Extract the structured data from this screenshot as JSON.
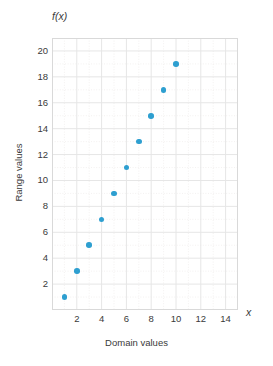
{
  "chart_data": {
    "type": "scatter",
    "title": "",
    "xlabel": "Domain values",
    "ylabel": "Range values",
    "x_axis_symbol": "x",
    "y_axis_symbol": "f(x)",
    "xlim": [
      0,
      15
    ],
    "ylim": [
      0,
      21
    ],
    "grid": true,
    "legend": "none",
    "x_ticks": [
      2,
      4,
      6,
      8,
      10,
      12,
      14
    ],
    "y_ticks": [
      2,
      4,
      6,
      8,
      10,
      12,
      14,
      16,
      18,
      20
    ],
    "x": [
      1,
      2,
      3,
      4,
      5,
      6,
      7,
      8,
      9,
      10
    ],
    "y": [
      1,
      3,
      5,
      7,
      9,
      11,
      13,
      15,
      17,
      19
    ],
    "points": [
      {
        "x": 1,
        "y": 1
      },
      {
        "x": 2,
        "y": 3
      },
      {
        "x": 3,
        "y": 5
      },
      {
        "x": 4,
        "y": 7
      },
      {
        "x": 5,
        "y": 9
      },
      {
        "x": 6,
        "y": 11
      },
      {
        "x": 7,
        "y": 13
      },
      {
        "x": 8,
        "y": 15
      },
      {
        "x": 9,
        "y": 17
      },
      {
        "x": 10,
        "y": 19
      }
    ],
    "series": [
      {
        "name": "f(x)",
        "values": [
          1,
          3,
          5,
          7,
          9,
          11,
          13,
          15,
          17,
          19
        ]
      }
    ]
  },
  "colors": {
    "marker": "#2e9fd0",
    "grid_major": "#e6e6e6",
    "grid_minor": "#f0eeec",
    "axis_line": "#d9d9d9",
    "text": "#3a3a3a",
    "background": "#ffffff"
  }
}
